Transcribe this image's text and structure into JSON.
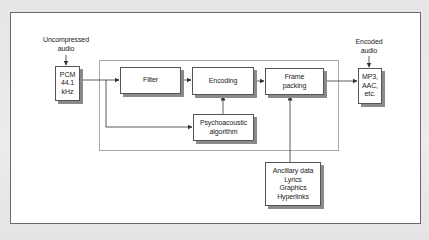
{
  "diagram": {
    "inputs": {
      "source_label": [
        "Uncompressed",
        "audio"
      ],
      "output_label": [
        "Encoded",
        "audio"
      ]
    },
    "blocks": {
      "pcm": [
        "PCM",
        "44.1",
        "kHz"
      ],
      "filter": [
        "Filter"
      ],
      "encoding": [
        "Encoding"
      ],
      "frame_packing": [
        "Frame",
        "packing"
      ],
      "output_formats": [
        "MP3,",
        "AAC,",
        "etc."
      ],
      "psychoacoustic": [
        "Psychoacoustic",
        "algorithm"
      ],
      "ancillary": [
        "Ancillary data",
        "Lyrics",
        "Graphics",
        "Hyperlinks"
      ]
    },
    "connections": [
      {
        "from": "Uncompressed audio",
        "to": "PCM 44.1 kHz"
      },
      {
        "from": "PCM 44.1 kHz",
        "to": "Filter"
      },
      {
        "from": "PCM 44.1 kHz",
        "to": "Psychoacoustic algorithm"
      },
      {
        "from": "Filter",
        "to": "Encoding"
      },
      {
        "from": "Psychoacoustic algorithm",
        "to": "Encoding"
      },
      {
        "from": "Encoding",
        "to": "Frame packing"
      },
      {
        "from": "Ancillary data",
        "to": "Frame packing"
      },
      {
        "from": "Frame packing",
        "to": "MP3, AAC, etc."
      },
      {
        "from": "Encoded audio",
        "to": "MP3, AAC, etc."
      }
    ],
    "colors": {
      "line": "#333333",
      "box_border": "#555555",
      "shadow": "#8a8a8a",
      "inner_frame": "#a8a8a8",
      "background": "#ffffff"
    }
  }
}
